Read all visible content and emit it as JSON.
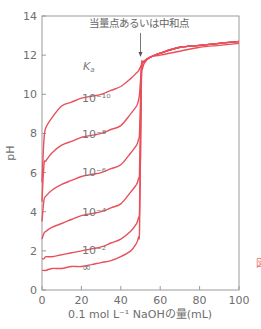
{
  "chart_data": {
    "type": "line",
    "title": "",
    "xlabel": "0.1 mol L⁻¹ NaOHの量(mL)",
    "ylabel": "pH",
    "xlim": [
      0,
      100
    ],
    "ylim": [
      0,
      14
    ],
    "xticks": [
      0,
      20,
      40,
      60,
      80,
      100
    ],
    "yticks": [
      0,
      2,
      4,
      6,
      8,
      10,
      12,
      14
    ],
    "grid": false,
    "legend_title": "Ka",
    "annotation": {
      "text": "当量点あるいは中和点",
      "arrow_x": 50,
      "arrow_from_pH": 13.3,
      "arrow_to_pH": 12.0
    },
    "equivalence_volume_mL": 50,
    "line_color": "#e8505b",
    "x": [
      0,
      1,
      2,
      5,
      10,
      15,
      20,
      25,
      30,
      35,
      40,
      45,
      48,
      49,
      49.5,
      50,
      50.5,
      51,
      52,
      55,
      60,
      70,
      80,
      90,
      100
    ],
    "series": [
      {
        "name": "10^-10",
        "label": "10⁻¹⁰",
        "values": [
          5.5,
          7.7,
          8.3,
          8.8,
          9.4,
          9.6,
          9.8,
          9.9,
          10.0,
          10.2,
          10.4,
          10.8,
          11.1,
          11.2,
          11.3,
          11.4,
          11.5,
          11.6,
          11.7,
          11.9,
          12.1,
          12.4,
          12.5,
          12.6,
          12.7
        ]
      },
      {
        "name": "10^-8",
        "label": "10⁻⁸",
        "values": [
          4.5,
          6.4,
          6.6,
          7.0,
          7.4,
          7.6,
          7.8,
          7.9,
          8.0,
          8.2,
          8.4,
          9.0,
          9.4,
          9.7,
          10.0,
          10.7,
          11.3,
          11.6,
          11.7,
          11.9,
          12.1,
          12.4,
          12.5,
          12.6,
          12.7
        ]
      },
      {
        "name": "10^-6",
        "label": "10⁻⁶",
        "values": [
          3.5,
          4.6,
          4.8,
          5.1,
          5.4,
          5.6,
          5.8,
          5.9,
          6.0,
          6.2,
          6.4,
          7.0,
          7.4,
          7.7,
          8.0,
          9.7,
          11.3,
          11.6,
          11.7,
          11.9,
          12.1,
          12.4,
          12.5,
          12.6,
          12.7
        ]
      },
      {
        "name": "10^-4",
        "label": "10⁻⁴",
        "values": [
          2.6,
          2.9,
          3.0,
          3.2,
          3.4,
          3.6,
          3.8,
          3.9,
          4.0,
          4.2,
          4.4,
          5.0,
          5.4,
          5.7,
          6.0,
          8.7,
          11.3,
          11.6,
          11.7,
          11.9,
          12.1,
          12.4,
          12.5,
          12.6,
          12.7
        ]
      },
      {
        "name": "10^-2",
        "label": "10⁻²",
        "values": [
          1.6,
          1.6,
          1.7,
          1.7,
          1.8,
          1.9,
          2.0,
          2.1,
          2.2,
          2.4,
          2.6,
          3.0,
          3.4,
          3.7,
          4.0,
          7.0,
          11.3,
          11.6,
          11.7,
          11.9,
          12.1,
          12.4,
          12.5,
          12.6,
          12.7
        ]
      },
      {
        "name": "infinity",
        "label": "∞",
        "values": [
          1.0,
          1.0,
          1.0,
          1.1,
          1.1,
          1.2,
          1.2,
          1.3,
          1.4,
          1.5,
          1.7,
          2.0,
          2.4,
          2.7,
          3.0,
          7.0,
          11.0,
          11.3,
          11.6,
          11.9,
          12.0,
          12.2,
          12.4,
          12.5,
          12.6
        ]
      }
    ]
  },
  "labels": {
    "ka_label": "K",
    "ka_sub": "a",
    "edge_mark": "図"
  }
}
